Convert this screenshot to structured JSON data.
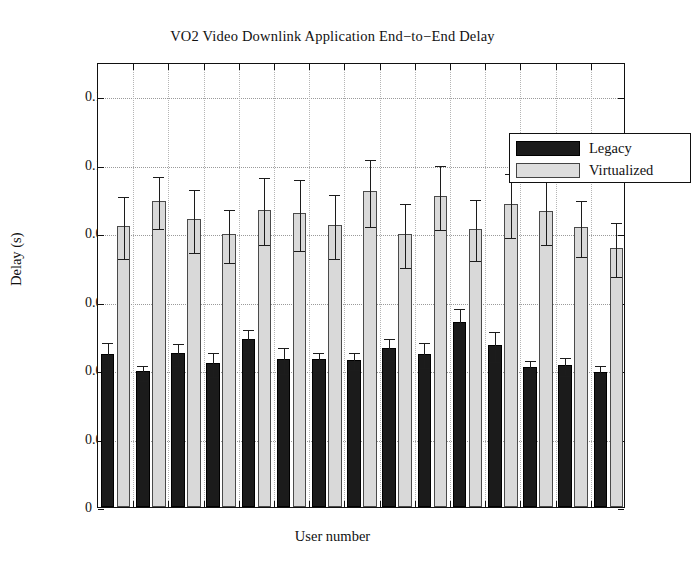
{
  "chart_data": {
    "type": "bar",
    "title": "VO2 Video Downlink Application End−to−End Delay",
    "xlabel": "User number",
    "ylabel": "Delay (s)",
    "categories": [
      "1",
      "2",
      "3",
      "4",
      "5",
      "6",
      "7",
      "8",
      "9",
      "10",
      "11",
      "12",
      "13",
      "14",
      "15"
    ],
    "ylim": [
      0,
      0.13
    ],
    "yticks": [
      0,
      0.02,
      0.04,
      0.06,
      0.08,
      0.1,
      0.12
    ],
    "ytick_labels": [
      "0",
      "0.02",
      "0.04",
      "0.06",
      "0.08",
      "0.1",
      "0.12"
    ],
    "grid": true,
    "legend_position": "top-right",
    "series": [
      {
        "name": "Legacy",
        "color": "#1b1b1b",
        "values": [
          0.0447,
          0.0396,
          0.045,
          0.0421,
          0.0492,
          0.0433,
          0.0431,
          0.043,
          0.0465,
          0.0448,
          0.0541,
          0.0473,
          0.0408,
          0.0416,
          0.0394
        ],
        "err_low": [
          0.0037,
          0.0022,
          0.0032,
          0.0035,
          0.0032,
          0.0038,
          0.0024,
          0.0025,
          0.0032,
          0.0036,
          0.0044,
          0.0043,
          0.0024,
          0.0026,
          0.0023
        ],
        "err_high": [
          0.0037,
          0.0022,
          0.0032,
          0.0035,
          0.0032,
          0.0038,
          0.0024,
          0.0025,
          0.0032,
          0.0036,
          0.0044,
          0.0043,
          0.0024,
          0.0026,
          0.0023
        ]
      },
      {
        "name": "Virtualized",
        "color": "#d9d9d9",
        "values": [
          0.082,
          0.0894,
          0.084,
          0.0797,
          0.0869,
          0.0858,
          0.0824,
          0.0922,
          0.0798,
          0.0909,
          0.0813,
          0.0886,
          0.0864,
          0.0818,
          0.0757
        ],
        "err_low": [
          0.0091,
          0.0076,
          0.0092,
          0.0077,
          0.0098,
          0.0103,
          0.0093,
          0.0098,
          0.0094,
          0.0094,
          0.0089,
          0.0094,
          0.0094,
          0.0082,
          0.0079
        ],
        "err_high": [
          0.0091,
          0.0076,
          0.0092,
          0.0077,
          0.0098,
          0.0103,
          0.0093,
          0.0098,
          0.0094,
          0.0094,
          0.0089,
          0.0094,
          0.0094,
          0.0082,
          0.0079
        ]
      }
    ]
  },
  "legend": {
    "items": [
      {
        "label": "Legacy",
        "color": "#1b1b1b"
      },
      {
        "label": "Virtualized",
        "color": "#dedede"
      }
    ]
  }
}
